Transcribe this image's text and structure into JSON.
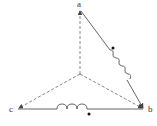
{
  "diagram": {
    "type": "three-phase connection diagram",
    "nodes": [
      {
        "id": "a",
        "label": "a"
      },
      {
        "id": "b",
        "label": "b"
      },
      {
        "id": "c",
        "label": "c"
      }
    ],
    "edges": [
      {
        "from": "a",
        "to": "b",
        "style": "solid",
        "element": "inductor",
        "polarity_dot": true
      },
      {
        "from": "c",
        "to": "b",
        "style": "solid",
        "element": "inductor",
        "polarity_dot": true
      },
      {
        "from": "center",
        "to": "a",
        "style": "dashed",
        "arrow": true
      },
      {
        "from": "center",
        "to": "b",
        "style": "dashed",
        "arrow": true
      },
      {
        "from": "center",
        "to": "c",
        "style": "dashed",
        "arrow": true
      }
    ],
    "colors": {
      "line": "#555555",
      "text": "#333333"
    }
  }
}
